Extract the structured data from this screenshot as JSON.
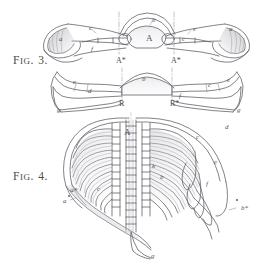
{
  "plate": {
    "width": 265,
    "height": 268,
    "background_color": "#ffffff",
    "ink_color": "#55555d",
    "medium": "engraved anatomical plate, grey line-work on white paper"
  },
  "figures": [
    {
      "id": "fig3",
      "caption_lead": "F",
      "caption_rest": "IG",
      "caption_dot": ".",
      "caption_number": "3.",
      "caption_full": "FIG. 3.",
      "labels": [
        {
          "key": "a_left",
          "text": "a",
          "x": 59,
          "y": 36
        },
        {
          "key": "c_left",
          "text": "c",
          "x": 89,
          "y": 25
        },
        {
          "key": "f_left",
          "text": "f",
          "x": 91,
          "y": 46
        },
        {
          "key": "b_top",
          "text": "b",
          "x": 152,
          "y": 17
        },
        {
          "key": "A_center",
          "text": "A",
          "x": 146,
          "y": 34
        },
        {
          "key": "e_right",
          "text": "e",
          "x": 193,
          "y": 26
        },
        {
          "key": "c_right",
          "text": "c",
          "x": 182,
          "y": 36
        },
        {
          "key": "a_right",
          "text": "a",
          "x": 229,
          "y": 26
        },
        {
          "key": "Astar_l",
          "text": "A*",
          "x": 116,
          "y": 57
        },
        {
          "key": "Astar_r",
          "text": "A*",
          "x": 171,
          "y": 57
        }
      ]
    },
    {
      "id": "fig3b",
      "caption_full": "",
      "labels": [
        {
          "key": "e_left2",
          "text": "e",
          "x": 73,
          "y": 79
        },
        {
          "key": "d_left2",
          "text": "d",
          "x": 88,
          "y": 88
        },
        {
          "key": "b_top2",
          "text": "b",
          "x": 142,
          "y": 76
        },
        {
          "key": "f_right2",
          "text": "f",
          "x": 179,
          "y": 93
        },
        {
          "key": "c_right2",
          "text": "c",
          "x": 208,
          "y": 82
        },
        {
          "key": "e_right2",
          "text": "e",
          "x": 227,
          "y": 77
        },
        {
          "key": "g_left2",
          "text": "g",
          "x": 57,
          "y": 107
        },
        {
          "key": "g_right2",
          "text": "g",
          "x": 237,
          "y": 107
        },
        {
          "key": "Rstar_l",
          "text": "R",
          "x": 119,
          "y": 100
        },
        {
          "key": "Rstar_r",
          "text": "R*",
          "x": 170,
          "y": 100
        }
      ]
    },
    {
      "id": "fig4",
      "caption_lead": "F",
      "caption_rest": "IG",
      "caption_dot": ".",
      "caption_number": "4.",
      "caption_full": "FIG. 4.",
      "labels": [
        {
          "key": "A_top4",
          "text": "A",
          "x": 124,
          "y": 128
        },
        {
          "key": "c_right4",
          "text": "c",
          "x": 196,
          "y": 134
        },
        {
          "key": "d_right4",
          "text": "d",
          "x": 225,
          "y": 124
        },
        {
          "key": "e_right4",
          "text": "e",
          "x": 214,
          "y": 159
        },
        {
          "key": "b_mid4",
          "text": "b",
          "x": 160,
          "y": 174
        },
        {
          "key": "k_mid4",
          "text": "k",
          "x": 152,
          "y": 163
        },
        {
          "key": "f_right4",
          "text": "f",
          "x": 206,
          "y": 181
        },
        {
          "key": "a_left4",
          "text": "a",
          "x": 63,
          "y": 198
        },
        {
          "key": "astar4",
          "text": "a*",
          "x": 70,
          "y": 187
        },
        {
          "key": "c_left4",
          "text": "c",
          "x": 97,
          "y": 186
        },
        {
          "key": "bstar4",
          "text": "b*",
          "x": 241,
          "y": 205
        },
        {
          "key": "g_bottom4",
          "text": "g",
          "x": 151,
          "y": 253
        }
      ]
    }
  ]
}
